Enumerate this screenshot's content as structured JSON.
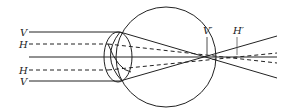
{
  "diagram": {
    "labels": {
      "v_top": "V",
      "h_top": "H",
      "h_bottom": "H",
      "v_bottom": "V",
      "v_prime": "V′",
      "h_prime": "H′"
    },
    "colors": {
      "stroke": "#222222",
      "background": "#ffffff"
    }
  }
}
